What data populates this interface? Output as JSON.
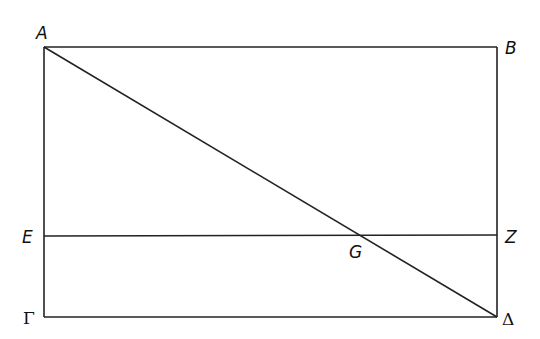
{
  "diagram": {
    "type": "geometric figure",
    "stroke_color": "#222222",
    "points": {
      "A": {
        "label": "A",
        "x": 44,
        "y": 47
      },
      "B": {
        "label": "B",
        "x": 497,
        "y": 47
      },
      "E": {
        "label": "E",
        "x": 44,
        "y": 236
      },
      "Z": {
        "label": "Z",
        "x": 497,
        "y": 236
      },
      "G": {
        "label": "G",
        "x": 364,
        "y": 236
      },
      "Gamma": {
        "label": "Γ",
        "x": 44,
        "y": 317
      },
      "Delta": {
        "label": "Δ",
        "x": 497,
        "y": 317
      }
    },
    "segments": [
      "AB",
      "AΓ",
      "BΔ",
      "ΓΔ",
      "EZ",
      "AΔ"
    ]
  }
}
